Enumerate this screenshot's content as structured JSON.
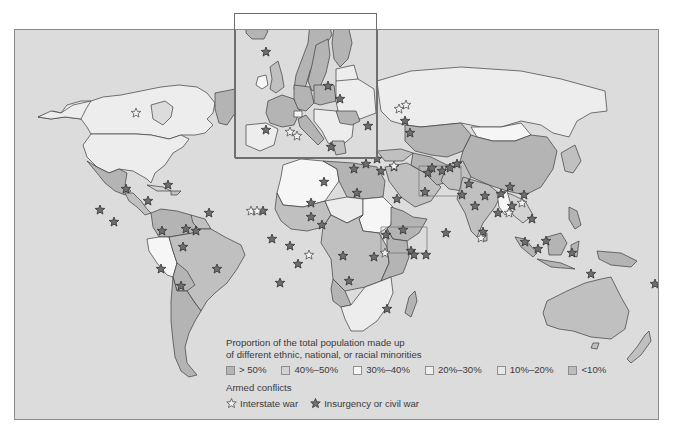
{
  "map": {
    "ocean_color": "#dcdcdc",
    "border_color": "#3c3c3c",
    "fill_colors": {
      "gt50": "#b4b4b4",
      "40to50": "#cbcbcb",
      "30to40": "#f6f6f6",
      "20to30": "#ededed",
      "10to20": "#e6e6e6",
      "lt10": "#c0c0c0"
    },
    "inset_label": "Europe inset"
  },
  "legend": {
    "title_line1": "Proportion of the total population made up",
    "title_line2": "of different ethnic, national, or racial minorities",
    "categories": [
      {
        "label": "> 50%",
        "color": "#b4b4b4"
      },
      {
        "label": "40%–50%",
        "color": "#d2d2d2"
      },
      {
        "label": "30%–40%",
        "color": "#f6f6f6"
      },
      {
        "label": "20%–30%",
        "color": "#eeeeee"
      },
      {
        "label": "10%–20%",
        "color": "#e8e8e8"
      },
      {
        "label": "<10%",
        "color": "#bdbdbd"
      }
    ],
    "conflicts_title": "Armed conflicts",
    "conflict_types": [
      {
        "label": "Interstate war",
        "icon": "outline-star-icon"
      },
      {
        "label": "Insurgency or civil war",
        "icon": "filled-star-icon"
      }
    ]
  },
  "markers": {
    "interstate": [
      [
        250,
        210
      ],
      [
        256,
        210
      ],
      [
        308,
        254
      ],
      [
        384,
        252
      ],
      [
        393,
        165
      ],
      [
        135,
        112
      ],
      [
        405,
        104
      ],
      [
        398,
        108
      ],
      [
        480,
        237
      ],
      [
        508,
        212
      ],
      [
        521,
        202
      ]
    ],
    "civil": [
      [
        125,
        188
      ],
      [
        99,
        209
      ],
      [
        113,
        221
      ],
      [
        167,
        184
      ],
      [
        147,
        200
      ],
      [
        208,
        212
      ],
      [
        185,
        228
      ],
      [
        195,
        230
      ],
      [
        161,
        230
      ],
      [
        182,
        246
      ],
      [
        160,
        268
      ],
      [
        180,
        285
      ],
      [
        216,
        268
      ],
      [
        262,
        210
      ],
      [
        323,
        181
      ],
      [
        310,
        202
      ],
      [
        271,
        238
      ],
      [
        289,
        245
      ],
      [
        297,
        263
      ],
      [
        279,
        282
      ],
      [
        321,
        224
      ],
      [
        310,
        216
      ],
      [
        356,
        192
      ],
      [
        385,
        234
      ],
      [
        342,
        255
      ],
      [
        373,
        256
      ],
      [
        348,
        280
      ],
      [
        386,
        308
      ],
      [
        396,
        198
      ],
      [
        402,
        229
      ],
      [
        410,
        250
      ],
      [
        413,
        254
      ],
      [
        425,
        254
      ],
      [
        424,
        191
      ],
      [
        431,
        167
      ],
      [
        380,
        170
      ],
      [
        376,
        158
      ],
      [
        393,
        166
      ],
      [
        365,
        163
      ],
      [
        353,
        168
      ],
      [
        409,
        132
      ],
      [
        365,
        113
      ],
      [
        404,
        120
      ],
      [
        427,
        172
      ],
      [
        449,
        167
      ],
      [
        456,
        163
      ],
      [
        441,
        170
      ],
      [
        468,
        183
      ],
      [
        461,
        194
      ],
      [
        484,
        195
      ],
      [
        474,
        205
      ],
      [
        500,
        193
      ],
      [
        511,
        205
      ],
      [
        509,
        186
      ],
      [
        531,
        218
      ],
      [
        523,
        194
      ],
      [
        497,
        212
      ],
      [
        445,
        232
      ],
      [
        482,
        231
      ],
      [
        524,
        241
      ],
      [
        537,
        248
      ],
      [
        545,
        240
      ],
      [
        571,
        252
      ],
      [
        590,
        273
      ],
      [
        654,
        283
      ],
      [
        242,
        150
      ],
      [
        258,
        138
      ],
      [
        270,
        129
      ]
    ],
    "inset_interstate": [
      [
        61,
        121
      ],
      [
        54,
        117
      ]
    ],
    "inset_civil": [
      [
        30,
        37
      ],
      [
        92,
        71
      ],
      [
        30,
        115
      ],
      [
        104,
        84
      ],
      [
        132,
        111
      ],
      [
        95,
        132
      ]
    ]
  }
}
